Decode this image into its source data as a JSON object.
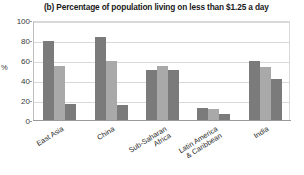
{
  "chart_data": {
    "type": "bar",
    "title": "(b) Percentage of population living on less than $1.25 a day",
    "xlabel": "",
    "ylabel": "%",
    "ylim": [
      0,
      100
    ],
    "yticks": [
      0,
      20,
      40,
      60,
      80,
      100
    ],
    "grid": true,
    "legend": "none",
    "categories": [
      "East Asia",
      "China",
      "Sub-Saharan Africa",
      "Latin America & Caribbean",
      "India"
    ],
    "category_lines": [
      [
        "East Asia"
      ],
      [
        "China"
      ],
      [
        "Sub-Saharan",
        "Africa"
      ],
      [
        "Latin America",
        "& Caribbean"
      ],
      [
        "India"
      ]
    ],
    "series": [
      {
        "name": "series-1",
        "color": "#7b7b7b",
        "values": [
          80,
          84,
          51,
          13,
          60
        ]
      },
      {
        "name": "series-2",
        "color": "#a9a9a9",
        "values": [
          55,
          60,
          55,
          12,
          54
        ]
      },
      {
        "name": "series-3",
        "color": "#7b7b7b",
        "values": [
          17,
          16,
          51,
          7,
          42
        ]
      }
    ]
  }
}
